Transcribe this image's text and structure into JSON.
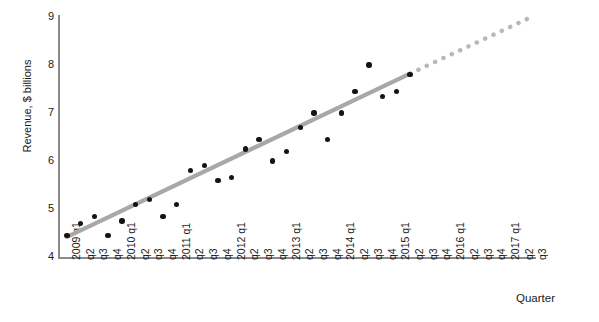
{
  "chart_data": {
    "type": "scatter",
    "title": "",
    "xlabel": "Quarter",
    "ylabel": "Revenue, $ billions",
    "ylim": [
      4,
      9
    ],
    "yticks": [
      4,
      5,
      6,
      7,
      8,
      9
    ],
    "grid": false,
    "legend": null,
    "categories": [
      "2009 q1",
      "q2",
      "q3",
      "q4",
      "2010 q1",
      "q2",
      "q3",
      "q4",
      "2011 q1",
      "q2",
      "q3",
      "q4",
      "2012 q1",
      "q2",
      "q3",
      "q4",
      "2013 q1",
      "q2",
      "q3",
      "q4",
      "2014 q1",
      "q2",
      "q3",
      "q4",
      "2015 q1",
      "q2",
      "q3",
      "q4",
      "2016 q1",
      "q2",
      "q3",
      "q4",
      "2017 q1",
      "q2",
      "q3"
    ],
    "series": [
      {
        "name": "Revenue",
        "marker": "circle",
        "color": "#141414",
        "x": [
          "2009 q1",
          "2009 q2",
          "2009 q3",
          "2009 q4",
          "2010 q1",
          "2010 q2",
          "2010 q3",
          "2010 q4",
          "2011 q1",
          "2011 q2",
          "2011 q3",
          "2011 q4",
          "2012 q1",
          "2012 q2",
          "2012 q3",
          "2012 q4",
          "2013 q1",
          "2013 q2",
          "2013 q3",
          "2013 q4",
          "2014 q1",
          "2014 q2",
          "2014 q3",
          "2014 q4",
          "2015 q1",
          "2015 q2"
        ],
        "values": [
          4.45,
          4.7,
          4.85,
          4.45,
          4.75,
          5.1,
          5.2,
          4.85,
          5.1,
          5.8,
          5.9,
          5.6,
          5.65,
          6.25,
          6.45,
          6.0,
          6.2,
          6.7,
          7.0,
          6.45,
          7.0,
          7.45,
          8.0,
          7.35,
          7.45,
          7.8
        ]
      },
      {
        "name": "Trend line (fitted)",
        "type": "line",
        "style": "solid",
        "color": "#a8a8a8",
        "x_start": "2009 q1",
        "x_end": "2015 q2",
        "y_start": 4.42,
        "y_end": 7.82
      },
      {
        "name": "Trend line (projected)",
        "type": "line",
        "style": "dotted",
        "color": "#b8b8b8",
        "x_start": "2015 q2",
        "x_end": "2017 q3",
        "y_start": 7.82,
        "y_end": 9.02
      }
    ]
  },
  "axes": {
    "y_title": "Revenue, $ billions",
    "x_title": "Quarter",
    "y_tick_labels": [
      "9",
      "8",
      "7",
      "6",
      "5",
      "4"
    ]
  }
}
